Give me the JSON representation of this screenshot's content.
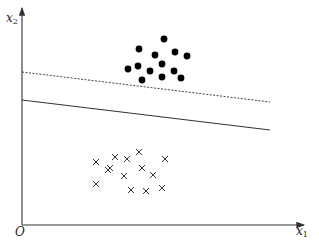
{
  "figure": {
    "axes": {
      "x_label": "x",
      "x_label_sub": "1",
      "y_label": "x",
      "y_label_sub": "2",
      "origin_label": "O"
    },
    "colors": {
      "axis": "#333333",
      "solid_line": "#333333",
      "dashed_line": "#444444",
      "dots": "#000000",
      "crosses": "#333333"
    },
    "lines": [
      {
        "name": "dashed-boundary",
        "style": "dashed",
        "x1": 22,
        "y1": 72,
        "x2": 270,
        "y2": 102
      },
      {
        "name": "solid-boundary",
        "style": "solid",
        "x1": 22,
        "y1": 100,
        "x2": 270,
        "y2": 130
      }
    ],
    "class_positive": {
      "marker": "filled-circle",
      "points": [
        [
          164,
          39
        ],
        [
          139,
          49
        ],
        [
          155,
          55
        ],
        [
          175,
          52
        ],
        [
          187,
          56
        ],
        [
          138,
          66
        ],
        [
          162,
          64
        ],
        [
          128,
          69
        ],
        [
          150,
          71
        ],
        [
          174,
          71
        ],
        [
          142,
          80
        ],
        [
          162,
          77
        ],
        [
          181,
          78
        ]
      ]
    },
    "class_negative": {
      "marker": "cross",
      "points": [
        [
          108,
          170
        ],
        [
          96,
          162
        ],
        [
          115,
          157
        ],
        [
          127,
          159
        ],
        [
          139,
          152
        ],
        [
          110,
          168
        ],
        [
          124,
          176
        ],
        [
          142,
          168
        ],
        [
          153,
          175
        ],
        [
          165,
          159
        ],
        [
          96,
          184
        ],
        [
          131,
          190
        ],
        [
          146,
          191
        ],
        [
          162,
          188
        ]
      ]
    }
  }
}
